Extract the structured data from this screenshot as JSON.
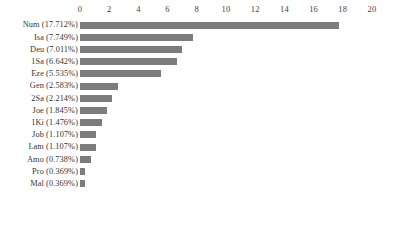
{
  "chart_data": {
    "type": "bar",
    "orientation": "horizontal",
    "title": "",
    "subtitle": "",
    "xlabel": "",
    "ylabel": "",
    "xlim": [
      0,
      20
    ],
    "xticks": [
      0,
      2,
      4,
      6,
      8,
      10,
      12,
      14,
      16,
      18,
      20
    ],
    "xtick_labels": [
      "0",
      "2",
      "4",
      "6",
      "8",
      "10",
      "12",
      "14",
      "16",
      "18",
      "20"
    ],
    "grid": false,
    "legend": null,
    "axis_position": "top",
    "bar_color": "#7c7c7c",
    "categories": [
      "Num",
      "Isa",
      "Deu",
      "1Sa",
      "Eze",
      "Gen",
      "2Sa",
      "Joe",
      "1Ki",
      "Job",
      "Lam",
      "Amo",
      "Pro",
      "Mal"
    ],
    "tick_labels": [
      "Num (17.712%)",
      "Isa (7.749%)",
      "Deu (7.011%)",
      "1Sa (6.642%)",
      "Eze (5.535%)",
      "Gen (2.583%)",
      "2Sa (2.214%)",
      "Joe (1.845%)",
      "1Ki (1.476%)",
      "Job (1.107%)",
      "Lam (1.107%)",
      "Amo (0.738%)",
      "Pro (0.369%)",
      "Mal (0.369%)"
    ],
    "percentages": [
      17.712,
      7.749,
      7.011,
      6.642,
      5.535,
      2.583,
      2.214,
      1.845,
      1.476,
      1.107,
      1.107,
      0.738,
      0.369,
      0.369
    ],
    "values": [
      17.712,
      7.749,
      7.011,
      6.642,
      5.535,
      2.583,
      2.214,
      1.845,
      1.476,
      1.107,
      1.107,
      0.738,
      0.369,
      0.369
    ]
  }
}
